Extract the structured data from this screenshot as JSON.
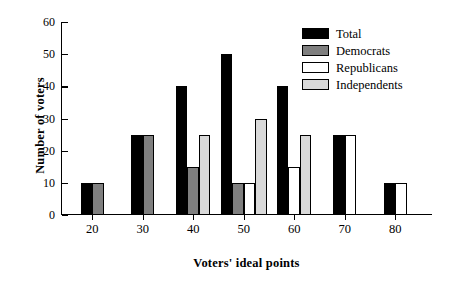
{
  "chart_data": {
    "type": "bar",
    "title": "",
    "xlabel": "Voters' ideal points",
    "ylabel": "Number of voters",
    "categories": [
      "20",
      "30",
      "40",
      "50",
      "60",
      "70",
      "80"
    ],
    "series": [
      {
        "name": "Total",
        "color": "#000000",
        "border": "#000000",
        "values": [
          10,
          25,
          40,
          50,
          40,
          25,
          10
        ]
      },
      {
        "name": "Democrats",
        "color": "#7f7f7f",
        "border": "#000000",
        "values": [
          10,
          25,
          15,
          10,
          null,
          null,
          null
        ]
      },
      {
        "name": "Republicans",
        "color": "#ffffff",
        "border": "#000000",
        "values": [
          null,
          null,
          null,
          10,
          15,
          25,
          10
        ]
      },
      {
        "name": "Independents",
        "color": "#d9d9d9",
        "border": "#000000",
        "values": [
          null,
          null,
          25,
          30,
          25,
          null,
          null
        ]
      }
    ],
    "ylim": [
      0,
      60
    ],
    "yticks": [
      0,
      10,
      20,
      30,
      40,
      50,
      60
    ],
    "ytick_labels": [
      "0",
      "10",
      "20",
      "30",
      "40",
      "50",
      "60"
    ],
    "xtick_labels": [
      "20",
      "30",
      "40",
      "50",
      "60",
      "70",
      "80"
    ],
    "grid": false,
    "legend_position": "top-right"
  },
  "legend": {
    "items": [
      {
        "label": "Total"
      },
      {
        "label": "Democrats"
      },
      {
        "label": "Republicans"
      },
      {
        "label": "Independents"
      }
    ]
  },
  "axes": {
    "y_label": "Number of voters",
    "x_label": "Voters' ideal points"
  }
}
